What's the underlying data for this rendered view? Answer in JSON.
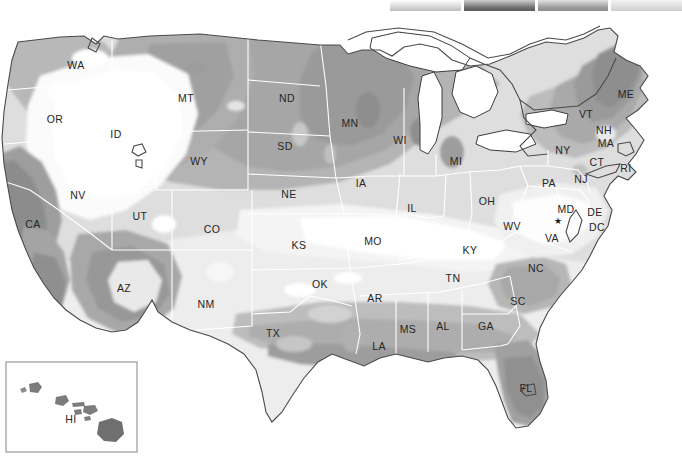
{
  "figure": {
    "kind": "choropleth-map",
    "region": "United States",
    "background_color": "#ffffff",
    "state_border_color": "#ffffff",
    "coastline_color": "#4a4a4a",
    "lake_fill": "#ffffff",
    "label_color": "#262626"
  },
  "legend": {
    "position": "top",
    "cut_off": true,
    "swatches": [
      {
        "name": "swatch-1",
        "gradient_from": "#ffffff",
        "gradient_to": "#bdbdbd"
      },
      {
        "name": "swatch-2",
        "gradient_from": "#cfcfcf",
        "gradient_to": "#5a5a5a"
      },
      {
        "name": "swatch-3",
        "gradient_from": "#e2e2e2",
        "gradient_to": "#8d8d8d"
      },
      {
        "name": "swatch-4",
        "gradient_from": "#f4f4f4",
        "gradient_to": "#cfcfcf"
      }
    ]
  },
  "shading_scale": {
    "type": "grayscale-bands",
    "bands": [
      {
        "level": 1,
        "color": "#ffffff",
        "label": "lowest"
      },
      {
        "level": 2,
        "color": "#f2f2f2",
        "label": "very low"
      },
      {
        "level": 3,
        "color": "#e6e6e6",
        "label": "low"
      },
      {
        "level": 4,
        "color": "#d6d6d6",
        "label": "low-mid"
      },
      {
        "level": 5,
        "color": "#c4c4c4",
        "label": "mid"
      },
      {
        "level": 6,
        "color": "#b0b0b0",
        "label": "mid-high"
      },
      {
        "level": 7,
        "color": "#9c9c9c",
        "label": "high"
      },
      {
        "level": 8,
        "color": "#888888",
        "label": "higher"
      },
      {
        "level": 9,
        "color": "#747474",
        "label": "highest"
      }
    ]
  },
  "chart_data": {
    "type": "heatmap",
    "title": "",
    "xlabel": "",
    "ylabel": "",
    "legend_position": "top",
    "grid": false,
    "categories": [
      "WA",
      "OR",
      "CA",
      "NV",
      "ID",
      "MT",
      "WY",
      "UT",
      "AZ",
      "NM",
      "CO",
      "ND",
      "SD",
      "NE",
      "KS",
      "OK",
      "TX",
      "MN",
      "IA",
      "MO",
      "AR",
      "LA",
      "WI",
      "IL",
      "MI",
      "IN",
      "OH",
      "KY",
      "TN",
      "MS",
      "AL",
      "GA",
      "FL",
      "SC",
      "NC",
      "VA",
      "WV",
      "MD",
      "DE",
      "DC",
      "PA",
      "NJ",
      "NY",
      "CT",
      "RI",
      "MA",
      "VT",
      "NH",
      "ME",
      "HI"
    ],
    "values": [
      4,
      3,
      5,
      3,
      4,
      6,
      6,
      3,
      6,
      3,
      4,
      7,
      6,
      6,
      4,
      3,
      4,
      7,
      6,
      4,
      4,
      5,
      7,
      4,
      6,
      4,
      4,
      3,
      3,
      5,
      5,
      5,
      7,
      6,
      6,
      4,
      4,
      4,
      4,
      4,
      4,
      5,
      5,
      5,
      5,
      5,
      6,
      5,
      7,
      7
    ]
  },
  "state_labels": [
    {
      "abbr": "WA",
      "x": 76,
      "y": 52
    },
    {
      "abbr": "OR",
      "x": 55,
      "y": 106
    },
    {
      "abbr": "ID",
      "x": 116,
      "y": 121
    },
    {
      "abbr": "MT",
      "x": 186,
      "y": 85
    },
    {
      "abbr": "WY",
      "x": 199,
      "y": 148
    },
    {
      "abbr": "NV",
      "x": 78,
      "y": 182
    },
    {
      "abbr": "CA",
      "x": 33,
      "y": 211
    },
    {
      "abbr": "UT",
      "x": 140,
      "y": 203
    },
    {
      "abbr": "CO",
      "x": 212,
      "y": 216
    },
    {
      "abbr": "AZ",
      "x": 124,
      "y": 275
    },
    {
      "abbr": "NM",
      "x": 206,
      "y": 291
    },
    {
      "abbr": "ND",
      "x": 287,
      "y": 85
    },
    {
      "abbr": "SD",
      "x": 285,
      "y": 133
    },
    {
      "abbr": "NE",
      "x": 289,
      "y": 181
    },
    {
      "abbr": "KS",
      "x": 299,
      "y": 232
    },
    {
      "abbr": "OK",
      "x": 320,
      "y": 271
    },
    {
      "abbr": "TX",
      "x": 273,
      "y": 320
    },
    {
      "abbr": "MN",
      "x": 350,
      "y": 110
    },
    {
      "abbr": "IA",
      "x": 361,
      "y": 170
    },
    {
      "abbr": "MO",
      "x": 373,
      "y": 228
    },
    {
      "abbr": "AR",
      "x": 375,
      "y": 285
    },
    {
      "abbr": "LA",
      "x": 379,
      "y": 333
    },
    {
      "abbr": "WI",
      "x": 400,
      "y": 127
    },
    {
      "abbr": "IL",
      "x": 412,
      "y": 195
    },
    {
      "abbr": "MI",
      "x": 456,
      "y": 148
    },
    {
      "abbr": "OH",
      "x": 487,
      "y": 188
    },
    {
      "abbr": "KY",
      "x": 470,
      "y": 237
    },
    {
      "abbr": "TN",
      "x": 453,
      "y": 265
    },
    {
      "abbr": "MS",
      "x": 408,
      "y": 316
    },
    {
      "abbr": "AL",
      "x": 443,
      "y": 313
    },
    {
      "abbr": "GA",
      "x": 486,
      "y": 313
    },
    {
      "abbr": "WV",
      "x": 512,
      "y": 213
    },
    {
      "abbr": "SC",
      "x": 518,
      "y": 288
    },
    {
      "abbr": "NC",
      "x": 536,
      "y": 255
    },
    {
      "abbr": "VA",
      "x": 552,
      "y": 225
    },
    {
      "abbr": "MD",
      "x": 566,
      "y": 196
    },
    {
      "abbr": "DE",
      "x": 595,
      "y": 199
    },
    {
      "abbr": "DC",
      "x": 597,
      "y": 214
    },
    {
      "abbr": "PA",
      "x": 549,
      "y": 170
    },
    {
      "abbr": "NJ",
      "x": 581,
      "y": 166
    },
    {
      "abbr": "NY",
      "x": 563,
      "y": 137
    },
    {
      "abbr": "CT",
      "x": 597,
      "y": 149
    },
    {
      "abbr": "RI",
      "x": 626,
      "y": 155
    },
    {
      "abbr": "MA",
      "x": 606,
      "y": 130
    },
    {
      "abbr": "VT",
      "x": 586,
      "y": 101
    },
    {
      "abbr": "NH",
      "x": 604,
      "y": 117
    },
    {
      "abbr": "ME",
      "x": 626,
      "y": 81
    },
    {
      "abbr": "FL",
      "x": 526,
      "y": 375
    },
    {
      "abbr": "HI",
      "x": 71,
      "y": 406
    }
  ],
  "inset": {
    "name": "hawaii-inset",
    "label": "HI",
    "frame": {
      "x": 6,
      "y": 348,
      "width": 131,
      "height": 90
    }
  },
  "markers": [
    {
      "name": "capital-star-marker",
      "near": "MD",
      "glyph": "★",
      "x": 558,
      "y": 206
    }
  ]
}
